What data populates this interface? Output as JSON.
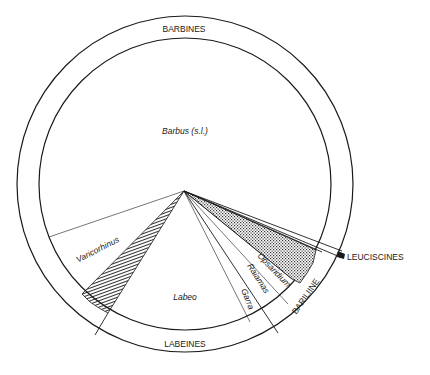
{
  "diagram": {
    "type": "pie-ring",
    "outer_ring_labels": {
      "barbines": "BARBINES",
      "labeines": "LABEINES",
      "bariliine": "BARILIINE",
      "leuciscines": "LEUCISCINES"
    },
    "segments": [
      {
        "name": "Barbus (s.l.)",
        "group": "BARBINES",
        "fill": "none"
      },
      {
        "name": "Varicorhinus",
        "group": "BARBINES",
        "fill": "none"
      },
      {
        "name": "unnamed hatched wedge",
        "group": "BARBINES/LABEINES",
        "fill": "hatched"
      },
      {
        "name": "Labeo",
        "group": "LABEINES",
        "fill": "none"
      },
      {
        "name": "Garra",
        "group": "LABEINES",
        "fill": "none"
      },
      {
        "name": "Raiamas",
        "group": "BARILIINE",
        "fill": "none"
      },
      {
        "name": "Opsaridium",
        "group": "BARILIINE",
        "fill": "none"
      },
      {
        "name": "stippled wedge",
        "group": "BARILIINE",
        "fill": "stippled"
      },
      {
        "name": "Leuciscines sliver",
        "group": "LEUCISCINES",
        "fill": "none"
      }
    ],
    "inner_labels": {
      "barbus": "Barbus (s.l.)",
      "varicorhinus": "Varicorhinus",
      "labeo": "Labeo",
      "garra": "Garra",
      "raiamas": "Raiamas",
      "opsaridium": "Opsaridium"
    },
    "colors": {
      "line": "#1a1a1a",
      "background": "#ffffff"
    }
  }
}
